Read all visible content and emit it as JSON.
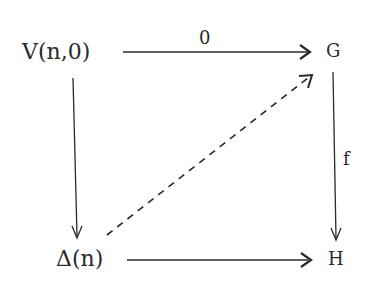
{
  "diagram": {
    "type": "commutative-square",
    "nodes": {
      "top_left": "V(n,0)",
      "top_right": "G",
      "bottom_left": "Δ(n)",
      "bottom_right": "H"
    },
    "arrows": {
      "top": {
        "from": "V(n,0)",
        "to": "G",
        "label": "0",
        "style": "solid"
      },
      "left": {
        "from": "V(n,0)",
        "to": "Δ(n)",
        "label": "",
        "style": "solid"
      },
      "right": {
        "from": "G",
        "to": "H",
        "label": "f",
        "style": "solid"
      },
      "bottom": {
        "from": "Δ(n)",
        "to": "H",
        "label": "",
        "style": "solid"
      },
      "diagonal": {
        "from": "Δ(n)",
        "to": "G",
        "label": "",
        "style": "dashed"
      }
    },
    "colors": {
      "ink": "#2a2a2a",
      "background": "#ffffff"
    }
  }
}
